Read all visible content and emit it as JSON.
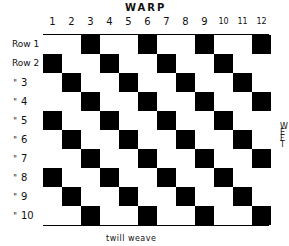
{
  "diagram": {
    "title": "WARP",
    "side_label": "WEFT",
    "side_label_letters": [
      "W",
      "E",
      "F",
      "T"
    ],
    "caption": "twill weave",
    "columns": [
      "1",
      "2",
      "3",
      "4",
      "5",
      "6",
      "7",
      "8",
      "9",
      "10",
      "11",
      "12"
    ],
    "rows": [
      {
        "label": "Row 1",
        "ditto": "",
        "num": "",
        "black_columns": [
          3,
          6,
          9,
          12
        ]
      },
      {
        "label": "Row 2",
        "ditto": "",
        "num": "",
        "black_columns": [
          1,
          4,
          7,
          10
        ]
      },
      {
        "label": "",
        "ditto": "\"",
        "num": "3",
        "black_columns": [
          2,
          5,
          8,
          11
        ]
      },
      {
        "label": "",
        "ditto": "\"",
        "num": "4",
        "black_columns": [
          3,
          6,
          9,
          12
        ]
      },
      {
        "label": "",
        "ditto": "\"",
        "num": "5",
        "black_columns": [
          1,
          4,
          7,
          10
        ]
      },
      {
        "label": "",
        "ditto": "\"",
        "num": "6",
        "black_columns": [
          2,
          5,
          8,
          11
        ]
      },
      {
        "label": "",
        "ditto": "\"",
        "num": "7",
        "black_columns": [
          3,
          6,
          9,
          12
        ]
      },
      {
        "label": "",
        "ditto": "\"",
        "num": "8",
        "black_columns": [
          1,
          4,
          7,
          10
        ]
      },
      {
        "label": "",
        "ditto": "\"",
        "num": "9",
        "black_columns": [
          2,
          5,
          8,
          11
        ]
      },
      {
        "label": "",
        "ditto": "\"",
        "num": "10",
        "black_columns": [
          3,
          6,
          9,
          12
        ]
      }
    ],
    "colors": {
      "filled": "#000000",
      "empty": "#ffffff"
    }
  }
}
